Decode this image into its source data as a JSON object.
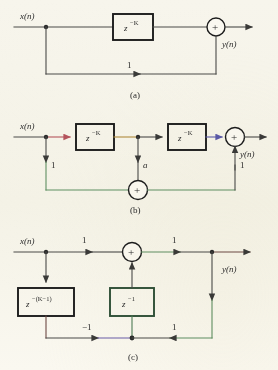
{
  "figure": {
    "background_color": "#f6f4ea",
    "ink_color": "#2b2b2b",
    "title": ""
  },
  "signals": {
    "input": "x(n)",
    "output": "y(n)"
  },
  "panels": [
    {
      "caption": "(a)",
      "blocks": [
        {
          "label": "z",
          "exponent": "−K"
        }
      ],
      "gains": [
        "1"
      ],
      "summers": [
        "+"
      ]
    },
    {
      "caption": "(b)",
      "blocks": [
        {
          "label": "z",
          "exponent": "−K"
        },
        {
          "label": "z",
          "exponent": "−K"
        }
      ],
      "gains": [
        "1",
        "a",
        "1"
      ],
      "summers": [
        "+",
        "+"
      ]
    },
    {
      "caption": "(c)",
      "blocks": [
        {
          "label": "z",
          "exponent": "−(K−1)"
        },
        {
          "label": "z",
          "exponent": "−1"
        }
      ],
      "gains": [
        "1",
        "1",
        "−1",
        "1"
      ],
      "summers": [
        "+"
      ]
    }
  ],
  "panel_a": {
    "caption": "(a)",
    "input_label": "x(n)",
    "output_label": "y(n)",
    "block_base": "z",
    "block_exp": "−K",
    "feedback_gain": "1",
    "summer_sign": "+"
  },
  "panel_b": {
    "caption": "(b)",
    "input_label": "x(n)",
    "output_label": "y(n)",
    "block1_base": "z",
    "block1_exp": "−K",
    "block2_base": "z",
    "block2_exp": "−K",
    "gain_left": "1",
    "gain_mid": "a",
    "gain_right": "1",
    "summer_main": "+",
    "summer_bottom": "+"
  },
  "panel_c": {
    "caption": "(c)",
    "input_label": "x(n)",
    "output_label": "y(n)",
    "block1_base": "z",
    "block1_exp": "−(K−1)",
    "block2_base": "z",
    "block2_exp": "−1",
    "gain_in": "1",
    "gain_out": "1",
    "gain_neg": "−1",
    "gain_fb": "1",
    "summer_sign": "+"
  },
  "colors": {
    "wire_default": "#4a4a48",
    "wire_red": "#b4545c",
    "wire_orange": "#b08a3c",
    "wire_blue": "#5a59a8",
    "wire_green": "#5f8f62",
    "wire_purple": "#6b5ca8",
    "wire_maroon": "#6d4a44",
    "box_stroke": "#1c1c1c"
  }
}
